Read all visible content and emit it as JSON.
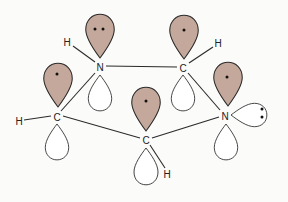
{
  "diagram": {
    "title": "",
    "colors": {
      "background": "#fbfbfa",
      "filled_orbital": "#c4a89b",
      "empty_orbital": "#ffffff",
      "stroke": "#2a2a2a"
    },
    "atoms": [
      {
        "id": "N1",
        "label": "N",
        "x": 100,
        "y": 67
      },
      {
        "id": "C2",
        "label": "C",
        "x": 183,
        "y": 68
      },
      {
        "id": "N3",
        "label": "N",
        "x": 225,
        "y": 116
      },
      {
        "id": "C4",
        "label": "C",
        "x": 146,
        "y": 140
      },
      {
        "id": "C5",
        "label": "C",
        "x": 57,
        "y": 117
      }
    ],
    "hydrogens": [
      {
        "id": "H1",
        "label": "H",
        "x": 67,
        "y": 42,
        "bonded_to": "N1"
      },
      {
        "id": "H2",
        "label": "H",
        "x": 218,
        "y": 43,
        "bonded_to": "C2"
      },
      {
        "id": "H4",
        "label": "H",
        "x": 166,
        "y": 174,
        "bonded_to": "C4"
      },
      {
        "id": "H5",
        "label": "H",
        "x": 19,
        "y": 121,
        "bonded_to": "C5"
      }
    ],
    "bonds": [
      [
        "N1",
        "C2"
      ],
      [
        "C2",
        "N3"
      ],
      [
        "N3",
        "C4"
      ],
      [
        "C4",
        "C5"
      ],
      [
        "C5",
        "N1"
      ]
    ],
    "p_orbitals": [
      {
        "atom": "N1",
        "electrons": 2,
        "electron_label": "••"
      },
      {
        "atom": "C2",
        "electrons": 1,
        "electron_label": "•"
      },
      {
        "atom": "N3",
        "electrons": 1,
        "electron_label": "•"
      },
      {
        "atom": "C4",
        "electrons": 1,
        "electron_label": "•"
      },
      {
        "atom": "C5",
        "electrons": 1,
        "electron_label": "•"
      }
    ],
    "lone_pair": {
      "atom": "N3",
      "electron_label": ":",
      "direction": "right"
    }
  }
}
